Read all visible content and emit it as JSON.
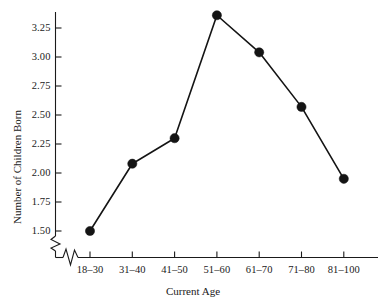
{
  "chart_data": {
    "type": "line",
    "title": "",
    "subtitle": "",
    "xlabel": "Current Age",
    "ylabel": "Number of Children Born",
    "categories": [
      "18–30",
      "31–40",
      "41–50",
      "51–60",
      "61–70",
      "71–80",
      "81–100"
    ],
    "values": [
      1.5,
      2.08,
      2.3,
      3.36,
      3.04,
      2.57,
      1.95
    ],
    "series": [
      {
        "name": "Number of Children Born",
        "values": [
          1.5,
          2.08,
          2.3,
          3.36,
          3.04,
          2.57,
          1.95
        ]
      }
    ],
    "ytick_labels": [
      "1.50",
      "1.75",
      "2.00",
      "2.25",
      "2.50",
      "2.75",
      "3.00",
      "3.25"
    ],
    "ytick_values": [
      1.5,
      1.75,
      2.0,
      2.25,
      2.5,
      2.75,
      3.0,
      3.25
    ],
    "ylim": [
      1.44,
      3.42
    ],
    "grid": "none",
    "legend": "none",
    "axis_break_y": true,
    "axis_break_x": true,
    "marker": "filled-circle",
    "line_color": "#141414",
    "marker_color": "#141414",
    "background_color": "#ffffff"
  },
  "axes": {
    "y_title": "Number of Children Born",
    "x_title": "Current Age"
  },
  "footer": {
    "cropped_caption_fragment": ""
  }
}
